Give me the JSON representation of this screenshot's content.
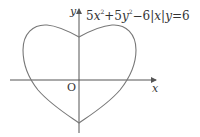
{
  "diagram": {
    "type": "curve-plot",
    "equation": {
      "parts": [
        "5",
        "x",
        "2",
        "+5",
        "y",
        "2",
        "−6",
        "|",
        "x",
        "|",
        "y",
        "=6"
      ],
      "text": "5x²+5y²−6|x|y=6"
    },
    "axes": {
      "x_label": "x",
      "y_label": "y",
      "origin_label": "O"
    },
    "curve": {
      "shape": "heart",
      "stroke_color": "#777777"
    },
    "axis_color": "#555555"
  }
}
